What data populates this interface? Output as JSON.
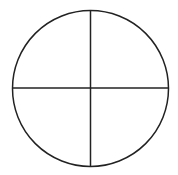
{
  "diagram": {
    "type": "circle-quadrants",
    "canvas": {
      "width": 178,
      "height": 175
    },
    "circle": {
      "cx": 90.5,
      "cy": 88.5,
      "r": 78
    },
    "vertical_line": {
      "x": 90.5,
      "y1": 11,
      "y2": 166
    },
    "horizontal_line": {
      "y": 88,
      "x1": 12,
      "x2": 169
    },
    "stroke_color": "#222222",
    "stroke_width": 1.5,
    "background_color": "#ffffff",
    "quadrants": 4
  }
}
